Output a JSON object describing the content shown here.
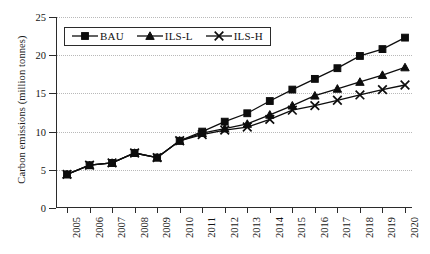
{
  "chart_data": {
    "type": "line",
    "title": "",
    "xlabel": "",
    "ylabel": "Carbon emissions (million tonnes)",
    "categories": [
      "2005",
      "2006",
      "2007",
      "2008",
      "2009",
      "2010",
      "2011",
      "2012",
      "2013",
      "2014",
      "2015",
      "2016",
      "2017",
      "2018",
      "2019",
      "2020"
    ],
    "x": [
      2005,
      2006,
      2007,
      2008,
      2009,
      2010,
      2011,
      2012,
      2013,
      2014,
      2015,
      2016,
      2017,
      2018,
      2019,
      2020
    ],
    "series": [
      {
        "name": "BAU",
        "marker": "square",
        "values": [
          4.4,
          5.6,
          5.9,
          7.2,
          6.6,
          8.8,
          10.0,
          11.3,
          12.4,
          14.0,
          15.5,
          16.9,
          18.3,
          19.9,
          20.8,
          22.3
        ]
      },
      {
        "name": "ILS-L",
        "marker": "triangle",
        "values": [
          4.4,
          5.6,
          5.9,
          7.2,
          6.6,
          8.8,
          9.8,
          10.4,
          11.0,
          12.2,
          13.4,
          14.7,
          15.6,
          16.5,
          17.4,
          18.4
        ]
      },
      {
        "name": "ILS-H",
        "marker": "cross",
        "values": [
          4.4,
          5.6,
          5.9,
          7.2,
          6.6,
          8.8,
          9.6,
          10.2,
          10.6,
          11.6,
          12.8,
          13.4,
          14.1,
          14.8,
          15.5,
          16.1
        ]
      }
    ],
    "ylim": [
      0,
      25
    ],
    "yticks": [
      0,
      5,
      10,
      15,
      20,
      25
    ],
    "ytick_labels": [
      "0",
      "5",
      "10",
      "15",
      "20",
      "25"
    ],
    "grid": true,
    "grid_style": "dotted",
    "grid_color": "#b9b9b9",
    "legend_position": "top-left",
    "line_color": "#0d0d0d"
  },
  "legend": {
    "items": [
      {
        "label": "BAU",
        "marker": "square-marker-icon"
      },
      {
        "label": "ILS-L",
        "marker": "triangle-marker-icon"
      },
      {
        "label": "ILS-H",
        "marker": "cross-marker-icon"
      }
    ]
  }
}
